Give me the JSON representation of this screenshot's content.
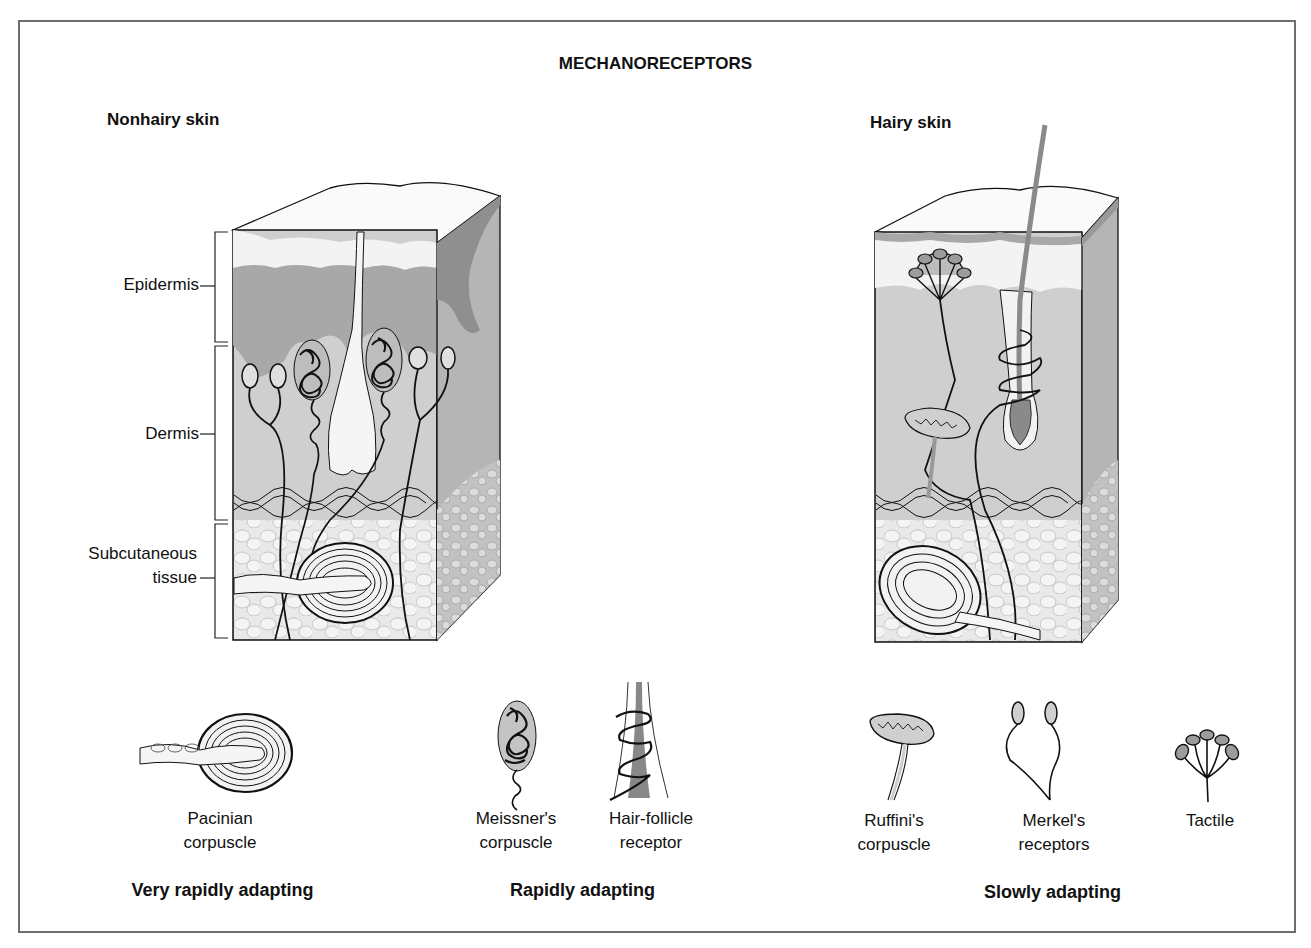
{
  "title": "MECHANORECEPTORS",
  "panels": {
    "nonhairy": {
      "label": "Nonhairy skin"
    },
    "hairy": {
      "label": "Hairy skin"
    }
  },
  "layers": [
    {
      "label": "Epidermis"
    },
    {
      "label": "Dermis"
    },
    {
      "label": "Subcutaneous",
      "label2": "tissue"
    }
  ],
  "receptors": [
    {
      "line1": "Pacinian",
      "line2": "corpuscle",
      "icon": "pacinian-corpuscle-icon"
    },
    {
      "line1": "Meissner's",
      "line2": "corpuscle",
      "icon": "meissner-corpuscle-icon"
    },
    {
      "line1": "Hair-follicle",
      "line2": "receptor",
      "icon": "hair-follicle-receptor-icon"
    },
    {
      "line1": "Ruffini's",
      "line2": "corpuscle",
      "icon": "ruffini-corpuscle-icon"
    },
    {
      "line1": "Merkel's",
      "line2": "receptors",
      "icon": "merkel-receptors-icon"
    },
    {
      "line1": "Tactile",
      "line2": "",
      "icon": "tactile-disc-icon"
    }
  ],
  "categories": [
    {
      "label": "Very rapidly adapting"
    },
    {
      "label": "Rapidly adapting"
    },
    {
      "label": "Slowly adapting"
    }
  ],
  "colors": {
    "epidermis_dark": "#a8a8a8",
    "dermis": "#cfcfcf",
    "side_face": "#b5b5b5",
    "subcutaneous": "#e6e6e6",
    "outline": "#111111",
    "frame": "#6e6e6e"
  }
}
